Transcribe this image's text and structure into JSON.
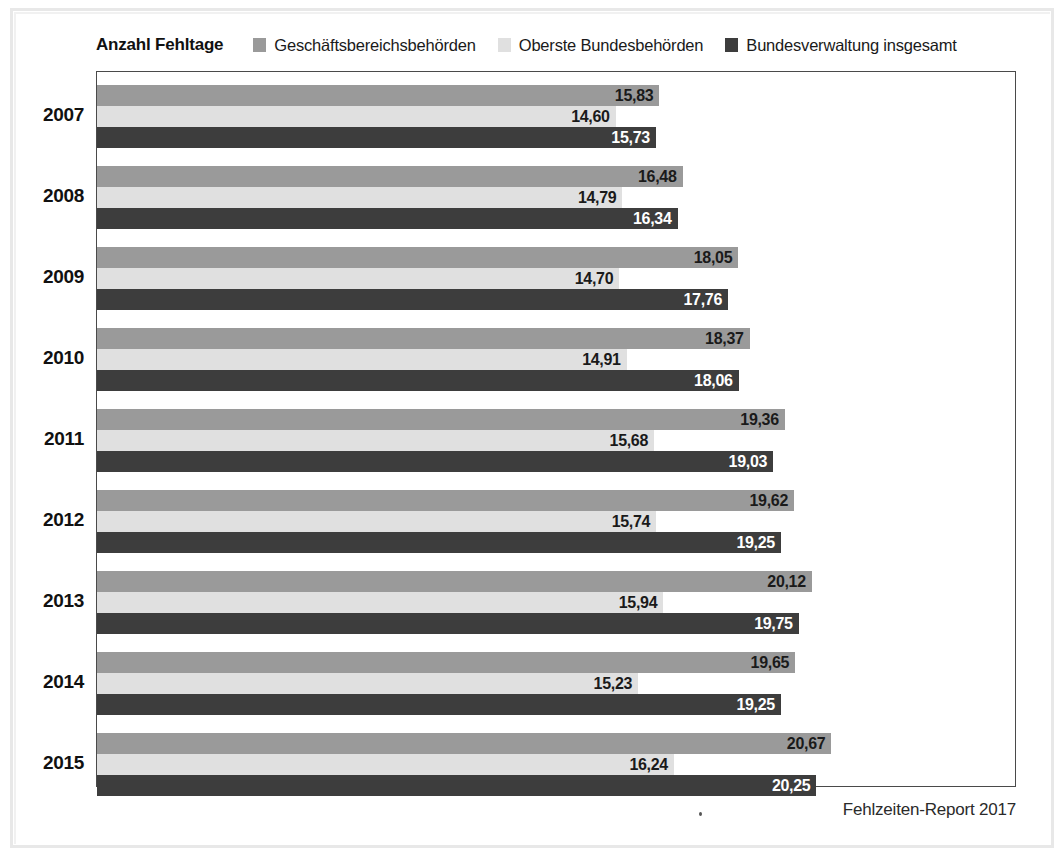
{
  "axis_title": "Anzahl Fehltage",
  "footer": "Fehlzeiten-Report 2017",
  "colors": {
    "series_1": "#9a9a9a",
    "series_2": "#e0e0e0",
    "series_3": "#3d3d3d",
    "plot_border": "#4a4a4a",
    "text": "#111111",
    "label_light_text": "#1a1a1a",
    "label_dark_text": "#ffffff"
  },
  "legend": {
    "items": [
      {
        "label": "Geschäftsbereichsbehörden",
        "color": "#9a9a9a"
      },
      {
        "label": "Oberste Bundesbehörden",
        "color": "#e0e0e0"
      },
      {
        "label": "Bundesverwaltung insgesamt",
        "color": "#3d3d3d"
      }
    ]
  },
  "chart_data": {
    "type": "bar",
    "orientation": "horizontal",
    "title": "",
    "xlabel": "Anzahl Fehltage",
    "ylabel": "",
    "grid": false,
    "legend_position": "top",
    "xlim": [
      0,
      24.6
    ],
    "categories": [
      "2007",
      "2008",
      "2009",
      "2010",
      "2011",
      "2012",
      "2013",
      "2014",
      "2015"
    ],
    "series": [
      {
        "name": "Geschäftsbereichsbehörden",
        "color": "#9a9a9a",
        "values": [
          15.83,
          16.48,
          18.05,
          18.37,
          19.36,
          19.62,
          20.12,
          19.65,
          20.67
        ],
        "labels": [
          "15,83",
          "16,48",
          "18,05",
          "18,37",
          "19,36",
          "19,62",
          "20,12",
          "19,65",
          "20,67"
        ]
      },
      {
        "name": "Oberste Bundesbehörden",
        "color": "#e0e0e0",
        "values": [
          14.6,
          14.79,
          14.7,
          14.91,
          15.68,
          15.74,
          15.94,
          15.23,
          16.24
        ],
        "labels": [
          "14,60",
          "14,79",
          "14,70",
          "14,91",
          "15,68",
          "15,74",
          "15,94",
          "15,23",
          "16,24"
        ]
      },
      {
        "name": "Bundesverwaltung insgesamt",
        "color": "#3d3d3d",
        "values": [
          15.73,
          16.34,
          17.76,
          18.06,
          19.03,
          19.25,
          19.75,
          19.25,
          20.25
        ],
        "labels": [
          "15,73",
          "16,34",
          "17,76",
          "18,06",
          "19,03",
          "19,25",
          "19,75",
          "19,25",
          "20,25"
        ]
      }
    ]
  }
}
